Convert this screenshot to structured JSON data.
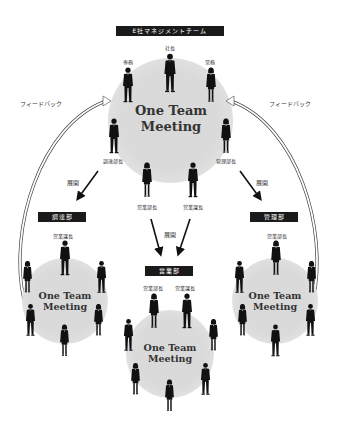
{
  "management": {
    "title": "E社マネジメントチーム",
    "president": "社長",
    "senior_md": "専務",
    "md": "常務",
    "procurement_head": "調達部長",
    "admin_head": "管理部長",
    "sales_head_1": "営業部長",
    "sales_head_2": "営業課長",
    "meeting": {
      "line1": "One Team",
      "line2": "Meeting"
    }
  },
  "feedback": {
    "left": "フィードバック",
    "right": "フィードバック"
  },
  "deploy": {
    "left": "展開",
    "center": "展開",
    "right": "展開"
  },
  "departments": [
    {
      "name": "調達部",
      "leader": "営業課長",
      "meeting": {
        "line1": "One Team",
        "line2": "Meeting"
      }
    },
    {
      "name": "営業部",
      "leader_1": "営業部長",
      "leader_2": "営業課長",
      "meeting": {
        "line1": "One Team",
        "line2": "Meeting"
      }
    },
    {
      "name": "管理部",
      "leader": "営業部長",
      "meeting": {
        "line1": "One Team",
        "line2": "Meeting"
      }
    }
  ],
  "colors": {
    "badge_bg": "#1a1a1a",
    "circle": "#d9d9d9",
    "figure": "#111111"
  }
}
